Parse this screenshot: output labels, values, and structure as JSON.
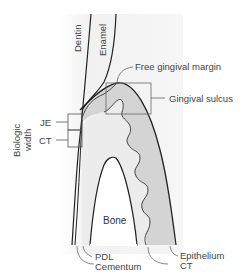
{
  "labels": {
    "dentin": "Dentin",
    "enamel": "Enamel",
    "free_gingival_margin": "Free gingival margin",
    "gingival_sulcus": "Gingival sulcus",
    "biologic_width_line1": "Biologic",
    "biologic_width_line2": "width",
    "je": "JE",
    "ct_left": "CT",
    "bone": "Bone",
    "pdl": "PDL",
    "cementum": "Cementum",
    "epithelium": "Epithelium",
    "ct_right": "CT"
  },
  "colors": {
    "background_shade": "#f0f0f0",
    "gingiva_epithelium": "#d6d6d6",
    "connective_tissue": "#ececec",
    "bone": "#ffffff",
    "outline": "#222222",
    "leader": "#777777"
  }
}
